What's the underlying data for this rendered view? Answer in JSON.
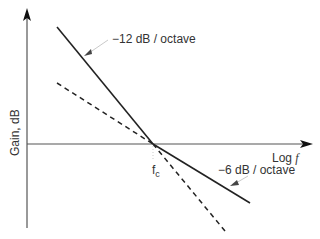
{
  "diagram": {
    "type": "bode-gain-asymptotes",
    "y_axis_label": "Gain, dB",
    "x_axis_label_prefix": "Log ",
    "x_axis_label_var": "f",
    "corner_label_main": "f",
    "corner_label_sub": "c",
    "lines": [
      {
        "name": "-12 dB/octave",
        "label": "−12 dB / octave",
        "style": "solid",
        "from": [
          57,
          27
        ],
        "to": [
          153,
          144
        ]
      },
      {
        "name": "-6 dB/octave",
        "label": "−6 dB / octave",
        "style": "solid",
        "from": [
          153,
          144
        ],
        "to": [
          250,
          203
        ]
      },
      {
        "name": "-6 dB/octave reference",
        "style": "dashed",
        "from": [
          57,
          83
        ],
        "to": [
          153,
          144
        ]
      },
      {
        "name": "-12 dB/octave reference",
        "style": "dashed",
        "from": [
          153,
          144
        ],
        "to": [
          225,
          231
        ]
      }
    ],
    "colors": {
      "line": "#222222",
      "axis": "#555555",
      "leader": "#bbbbbb",
      "text": "#333333"
    }
  }
}
